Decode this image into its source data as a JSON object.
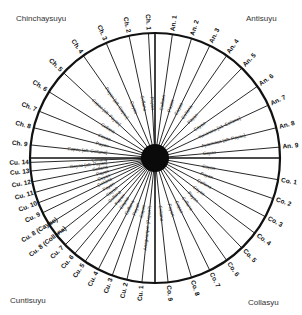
{
  "quadrants": {
    "top_left": "Chinchaysuyu",
    "top_right": "Antisuyu",
    "bottom_left": "Cuntisuyu",
    "bottom_right": "Collasyu"
  },
  "center": {
    "x": 155,
    "y": 158,
    "radius": 125,
    "hub_radius": 14
  },
  "colors": {
    "line": "#111111",
    "hub": "#0a0a0a",
    "text": "#222222"
  },
  "quarter_lines_deg": [
    0,
    90,
    180,
    270
  ],
  "ceques": [
    {
      "id": "An. 1",
      "angle": -82,
      "inner": "Collana"
    },
    {
      "id": "An. 2",
      "angle": -73,
      "inner": "Payan"
    },
    {
      "id": "An. 3",
      "angle": -64,
      "inner": "Cayao"
    },
    {
      "id": "An. 4",
      "angle": -55,
      "inner": "Collana"
    },
    {
      "id": "An. 5",
      "angle": -46,
      "inner": "Payan"
    },
    {
      "id": "An. 6",
      "angle": -35,
      "inner": "Cayao"
    },
    {
      "id": "An. 7",
      "angle": -25,
      "inner": "Yacanora [alt: Collana]"
    },
    {
      "id": "An. 8",
      "angle": -14,
      "inner": "Ayarmaca [alt: Payan]"
    },
    {
      "id": "An. 9",
      "angle": -5,
      "inner": "Cayao"
    },
    {
      "id": "Co. 1",
      "angle": 10,
      "inner": "Cayao"
    },
    {
      "id": "Co. 2",
      "angle": 19,
      "inner": "Payan"
    },
    {
      "id": "Co. 3",
      "angle": 28,
      "inner": "Collana"
    },
    {
      "id": "Co. 4",
      "angle": 37,
      "inner": "Cayao"
    },
    {
      "id": "Co. 5",
      "angle": 46,
      "inner": "Payan"
    },
    {
      "id": "Co. 6",
      "angle": 55,
      "inner": "Collana"
    },
    {
      "id": "Co. 7",
      "angle": 64,
      "inner": "Cayao"
    },
    {
      "id": "Co. 8",
      "angle": 73,
      "inner": "Payan"
    },
    {
      "id": "Co. 9",
      "angle": 84,
      "inner": "Collana"
    },
    {
      "id": "Cu. 1",
      "angle": 96,
      "inner": "Anaguarque (Payan?)"
    },
    {
      "id": "Cu. 2",
      "angle": 103,
      "inner": "Cayao"
    },
    {
      "id": "Cu. 3",
      "angle": 110,
      "inner": "Payan"
    },
    {
      "id": "Cu. 4",
      "angle": 117,
      "inner": "Collana"
    },
    {
      "id": "Cu. 5",
      "angle": 124,
      "inner": "Cayao"
    },
    {
      "id": "Cu. 6",
      "angle": 130,
      "inner": "Payan"
    },
    {
      "id": "Cu. 7",
      "angle": 136,
      "inner": "Collana"
    },
    {
      "id": "Cu. 8 (Collana)",
      "angle": 142,
      "inner": "Cayao"
    },
    {
      "id": "Cu. 8 (Cayao)",
      "angle": 148,
      "inner": "Payan"
    },
    {
      "id": "Cu. 9",
      "angle": 154,
      "inner": "Collana"
    },
    {
      "id": "Cu. 10",
      "angle": 159,
      "inner": "Cayao"
    },
    {
      "id": "Cu. 11",
      "angle": 164,
      "inner": "Payan"
    },
    {
      "id": "Cu. 12",
      "angle": 169,
      "inner": "Collana"
    },
    {
      "id": "Cu. 13",
      "angle": 174,
      "inner": "Cayao [alt: Payan]"
    },
    {
      "id": "Cu. 14",
      "angle": 178,
      "inner": "Collana"
    },
    {
      "id": "Ch. 9",
      "angle": -174,
      "inner": "Capac [alt: Collana]"
    },
    {
      "id": "Ch. 8",
      "angle": -166,
      "inner": "Payan"
    },
    {
      "id": "Ch. 7",
      "angle": -158,
      "inner": "Cayao"
    },
    {
      "id": "Ch. 6",
      "angle": -148,
      "inner": "Collana"
    },
    {
      "id": "Ch. 5",
      "angle": -137,
      "inner": "Capac [alt: Payan]"
    },
    {
      "id": "Ch. 4",
      "angle": -125,
      "inner": "Payan [alt: Cayao]"
    },
    {
      "id": "Ch. 3",
      "angle": -113,
      "inner": "Cayao"
    },
    {
      "id": "Ch. 2",
      "angle": -102,
      "inner": "Collana"
    },
    {
      "id": "Ch. 1",
      "angle": -93,
      "inner": "Payan"
    }
  ]
}
